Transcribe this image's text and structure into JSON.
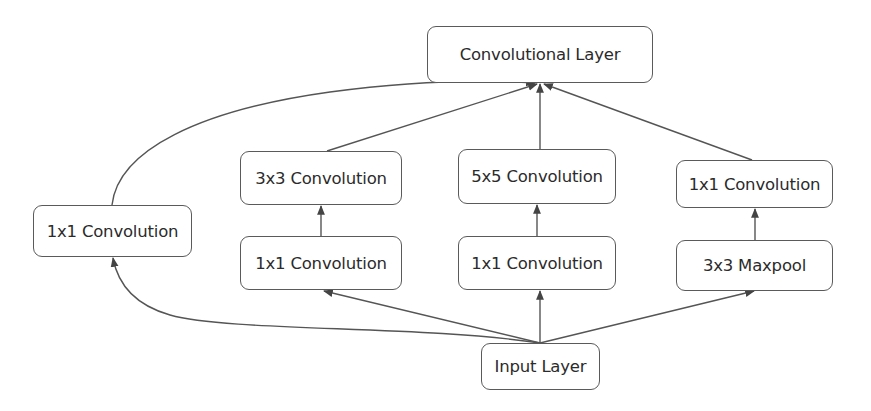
{
  "diagram": {
    "type": "inception-module",
    "nodes": {
      "output": {
        "label": "Convolutional Layer"
      },
      "branch1_conv1x1": {
        "label": "1x1 Convolution"
      },
      "branch2_conv1x1": {
        "label": "1x1 Convolution"
      },
      "branch2_conv3x3": {
        "label": "3x3 Convolution"
      },
      "branch3_conv1x1": {
        "label": "1x1 Convolution"
      },
      "branch3_conv5x5": {
        "label": "5x5 Convolution"
      },
      "branch4_maxpool": {
        "label": "3x3 Maxpool"
      },
      "branch4_conv1x1": {
        "label": "1x1 Convolution"
      },
      "input": {
        "label": "Input Layer"
      }
    },
    "edges": [
      {
        "from": "input",
        "to": "branch1_conv1x1"
      },
      {
        "from": "input",
        "to": "branch2_conv1x1"
      },
      {
        "from": "input",
        "to": "branch3_conv1x1"
      },
      {
        "from": "input",
        "to": "branch4_maxpool"
      },
      {
        "from": "branch2_conv1x1",
        "to": "branch2_conv3x3"
      },
      {
        "from": "branch3_conv1x1",
        "to": "branch3_conv5x5"
      },
      {
        "from": "branch4_maxpool",
        "to": "branch4_conv1x1"
      },
      {
        "from": "branch1_conv1x1",
        "to": "output"
      },
      {
        "from": "branch2_conv3x3",
        "to": "output"
      },
      {
        "from": "branch3_conv5x5",
        "to": "output"
      },
      {
        "from": "branch4_conv1x1",
        "to": "output"
      }
    ],
    "colors": {
      "stroke": "#555555",
      "text": "#2b2b2b",
      "background": "#ffffff"
    }
  }
}
